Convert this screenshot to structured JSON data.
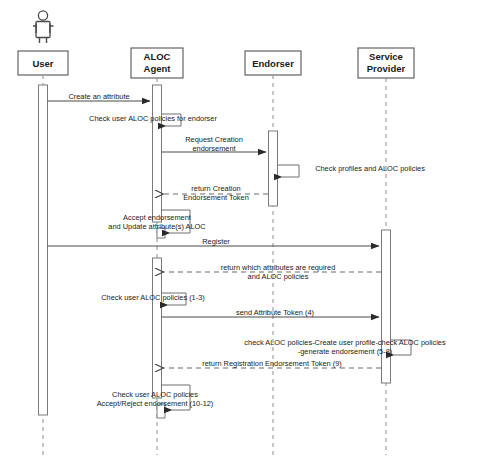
{
  "diagram": {
    "type": "uml-sequence-diagram",
    "width": 494,
    "height": 463,
    "background_color": "#ffffff",
    "line_color": "#4a4a4a",
    "lifeline_color": "#8d8d8d"
  },
  "participants": [
    {
      "id": "user",
      "label": "User",
      "label_line1": "User",
      "label_line2": "",
      "x": 43,
      "has_actor_figure": true
    },
    {
      "id": "aloc_agent",
      "label": "ALOC Agent",
      "label_line1": "ALOC",
      "label_line2": "Agent",
      "x": 157,
      "has_actor_figure": false
    },
    {
      "id": "endorser",
      "label": "Endorser",
      "label_line1": "Endorser",
      "label_line2": "",
      "x": 273,
      "has_actor_figure": false
    },
    {
      "id": "service_provider",
      "label": "Service Provider",
      "label_line1": "Service",
      "label_line2": "Provider",
      "x": 386,
      "has_actor_figure": false
    }
  ],
  "messages": [
    {
      "id": "m1",
      "label": "Create an attribute",
      "line1": "Create an attribute",
      "line2": "",
      "from": "user",
      "to": "aloc_agent",
      "kind": "call",
      "style": "solid",
      "y": 101
    },
    {
      "id": "m2",
      "label": "Check user ALOC policies for endorser",
      "line1": "Check user ALOC policies for endorser",
      "line2": "",
      "from": "aloc_agent",
      "to": "aloc_agent",
      "kind": "self",
      "style": "solid",
      "y": 124
    },
    {
      "id": "m3",
      "label": "Request Creation endorsement",
      "line1": "Request Creation",
      "line2": "endorsement",
      "from": "aloc_agent",
      "to": "endorser",
      "kind": "call",
      "style": "solid",
      "y": 152
    },
    {
      "id": "m4",
      "label": "Check profiles and ALOC policies",
      "line1": "Check profiles and ALOC policies",
      "line2": "",
      "from": "endorser",
      "to": "endorser",
      "kind": "self",
      "style": "solid",
      "y": 176
    },
    {
      "id": "m5",
      "label": "return Creation Endorsement Token",
      "line1": "return Creation",
      "line2": "Endorsement Token",
      "from": "endorser",
      "to": "aloc_agent",
      "kind": "return",
      "style": "dashed",
      "y": 194
    },
    {
      "id": "m6",
      "label": "Accept endorsement and Update attribute(s) ALOC",
      "line1": "Accept endorsement",
      "line2": "and Update attribute(s) ALOC",
      "from": "aloc_agent",
      "to": "aloc_agent",
      "kind": "self",
      "style": "solid",
      "y": 232
    },
    {
      "id": "m7",
      "label": "Register",
      "line1": "Register",
      "line2": "",
      "from": "user",
      "to": "service_provider",
      "kind": "call",
      "style": "solid",
      "y": 246
    },
    {
      "id": "m8",
      "label": "return which attributes are required and ALOC policies",
      "line1": "return which attributes are required",
      "line2": "and ALOC policies",
      "from": "service_provider",
      "to": "aloc_agent",
      "kind": "return",
      "style": "dashed",
      "y": 272
    },
    {
      "id": "m9",
      "label": "Check user ALOC policies (1-3)",
      "line1": "Check user ALOC policies (1-3)",
      "line2": "",
      "from": "aloc_agent",
      "to": "aloc_agent",
      "kind": "self",
      "style": "solid",
      "y": 303
    },
    {
      "id": "m10",
      "label": "send Attribute Token (4)",
      "line1": "send Attribute Token (4)",
      "line2": "",
      "from": "aloc_agent",
      "to": "service_provider",
      "kind": "call",
      "style": "solid",
      "y": 317
    },
    {
      "id": "m11",
      "label": "check ALOC policies-Create user profile-check ALOC policies -generate endorsement (5-8)",
      "line1": "check ALOC policies-Create user profile-check ALOC policies",
      "line2": "-generate endorsement (5-8)",
      "from": "service_provider",
      "to": "service_provider",
      "kind": "self",
      "style": "solid",
      "y": 353
    },
    {
      "id": "m12",
      "label": "return Registration Endorsement Token (9)",
      "line1": "return Registration Endorsement Token (9)",
      "line2": "",
      "from": "service_provider",
      "to": "aloc_agent",
      "kind": "return",
      "style": "dashed",
      "y": 368
    },
    {
      "id": "m13",
      "label": "Check user ALOC policies Accept/Reject endorsement (10-12)",
      "line1": "Check user ALOC policies",
      "line2": "Accept/Reject endorsement (10-12)",
      "from": "aloc_agent",
      "to": "aloc_agent",
      "kind": "self",
      "style": "solid",
      "y": 410
    }
  ],
  "activations": [
    {
      "id": "a-user",
      "participant": "user",
      "top": 85,
      "bottom": 415
    },
    {
      "id": "a-agent-1",
      "participant": "aloc_agent",
      "top": 85,
      "bottom": 222
    },
    {
      "id": "a-agent-2",
      "participant": "aloc_agent",
      "top": 258,
      "bottom": 398
    },
    {
      "id": "a-endorser",
      "participant": "endorser",
      "top": 131,
      "bottom": 206
    },
    {
      "id": "a-provider",
      "participant": "service_provider",
      "top": 230,
      "bottom": 383
    }
  ]
}
